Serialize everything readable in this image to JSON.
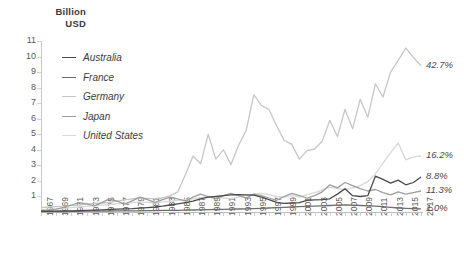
{
  "axis_title": "Billion\nUSD",
  "y_ticks": [
    0,
    1,
    2,
    3,
    4,
    5,
    6,
    7,
    8,
    9,
    10,
    11
  ],
  "y_tick_labels": [
    "",
    "1",
    "2",
    "3",
    "4",
    "5",
    "6",
    "7",
    "8",
    "9",
    "10",
    "11"
  ],
  "x_tick_labels": [
    "1967",
    "1969",
    "1971",
    "1973",
    "1975",
    "1977",
    "1979",
    "1981",
    "1983",
    "1985",
    "1987",
    "1989",
    "1991",
    "1993",
    "1995",
    "1997",
    "1999",
    "2001",
    "2003",
    "2005",
    "2007",
    "2009",
    "2011",
    "2013",
    "2015",
    "2017"
  ],
  "legend": {
    "position": "inside-top-left",
    "items": [
      {
        "label": "Australia",
        "color": "#4a4a4a"
      },
      {
        "label": "France",
        "color": "#6e6e6e"
      },
      {
        "label": "Germany",
        "color": "#c6c6c6"
      },
      {
        "label": "Japan",
        "color": "#9e9e9e"
      },
      {
        "label": "United States",
        "color": "#d8d8d8"
      }
    ]
  },
  "end_labels": [
    {
      "text": "42.7%",
      "value": 9.4,
      "series": "Germany"
    },
    {
      "text": "16.2%",
      "value": 3.6,
      "series": "United States"
    },
    {
      "text": "8.8%",
      "value": 2.25,
      "series": "Australia"
    },
    {
      "text": "11.3%",
      "value": 1.35,
      "series": "Japan"
    },
    {
      "text": "1.0%",
      "value": 0.2,
      "series": "France"
    }
  ],
  "chart_data": {
    "type": "line",
    "title": "",
    "subtitle": "",
    "xlabel": "",
    "ylabel": "Billion USD",
    "ylim": [
      0,
      11
    ],
    "xlim": [
      1967,
      2017
    ],
    "grid": false,
    "x": [
      1967,
      1968,
      1969,
      1970,
      1971,
      1972,
      1973,
      1974,
      1975,
      1976,
      1977,
      1978,
      1979,
      1980,
      1981,
      1982,
      1983,
      1984,
      1985,
      1986,
      1987,
      1988,
      1989,
      1990,
      1991,
      1992,
      1993,
      1994,
      1995,
      1996,
      1997,
      1998,
      1999,
      2000,
      2001,
      2002,
      2003,
      2004,
      2005,
      2006,
      2007,
      2008,
      2009,
      2010,
      2011,
      2012,
      2013,
      2014,
      2015,
      2016,
      2017
    ],
    "series": [
      {
        "name": "Australia",
        "color": "#4a4a4a",
        "values": [
          0.05,
          0.05,
          0.06,
          0.07,
          0.08,
          0.09,
          0.1,
          0.12,
          0.14,
          0.16,
          0.18,
          0.2,
          0.22,
          0.25,
          0.28,
          0.32,
          0.38,
          0.45,
          0.52,
          0.6,
          0.7,
          0.85,
          0.95,
          1.0,
          1.05,
          1.1,
          1.12,
          1.1,
          1.08,
          0.95,
          0.8,
          0.62,
          0.55,
          0.58,
          0.6,
          0.75,
          0.78,
          0.8,
          0.85,
          1.15,
          1.5,
          1.05,
          1.0,
          1.05,
          2.3,
          2.1,
          1.85,
          2.05,
          1.75,
          1.9,
          2.25
        ]
      },
      {
        "name": "France",
        "color": "#6e6e6e",
        "values": [
          0.02,
          0.02,
          0.03,
          0.03,
          0.04,
          0.04,
          0.05,
          0.05,
          0.06,
          0.06,
          0.07,
          0.07,
          0.08,
          0.08,
          0.09,
          0.09,
          0.1,
          0.1,
          0.11,
          0.12,
          0.13,
          0.14,
          0.15,
          0.16,
          0.17,
          0.18,
          0.19,
          0.2,
          0.22,
          0.24,
          0.26,
          0.28,
          0.3,
          0.32,
          0.34,
          0.36,
          0.38,
          0.4,
          0.42,
          0.44,
          0.46,
          0.44,
          0.42,
          0.4,
          0.38,
          0.34,
          0.3,
          0.26,
          0.23,
          0.21,
          0.2
        ]
      },
      {
        "name": "Germany",
        "color": "#c6c6c6",
        "values": [
          0.3,
          0.32,
          0.35,
          0.38,
          0.42,
          0.45,
          0.5,
          0.55,
          0.58,
          0.62,
          0.7,
          0.78,
          0.85,
          0.9,
          0.88,
          0.85,
          0.9,
          1.05,
          1.3,
          2.4,
          3.6,
          3.1,
          5.0,
          3.4,
          4.0,
          3.05,
          4.3,
          5.25,
          7.55,
          6.85,
          6.6,
          5.55,
          4.6,
          4.35,
          3.4,
          3.95,
          4.05,
          4.55,
          5.9,
          4.85,
          6.6,
          5.35,
          7.25,
          6.1,
          8.25,
          7.4,
          9.0,
          9.75,
          10.55,
          9.95,
          9.4
        ]
      },
      {
        "name": "Japan",
        "color": "#9e9e9e",
        "values": [
          0.1,
          0.12,
          0.18,
          0.3,
          0.45,
          0.6,
          0.52,
          0.4,
          0.6,
          0.85,
          0.7,
          0.5,
          0.72,
          0.95,
          0.8,
          0.62,
          0.8,
          0.95,
          0.85,
          0.7,
          0.95,
          1.15,
          1.0,
          0.85,
          1.05,
          1.2,
          1.05,
          0.9,
          1.15,
          1.05,
          0.9,
          0.75,
          1.0,
          1.2,
          1.05,
          0.9,
          1.05,
          1.3,
          1.75,
          1.55,
          1.9,
          1.7,
          1.5,
          1.35,
          1.45,
          1.25,
          1.1,
          1.3,
          1.15,
          1.25,
          1.35
        ]
      },
      {
        "name": "United States",
        "color": "#d8d8d8",
        "values": [
          0.15,
          0.18,
          0.2,
          0.24,
          0.28,
          0.32,
          0.36,
          0.4,
          0.44,
          0.48,
          0.52,
          0.56,
          0.6,
          0.65,
          0.62,
          0.58,
          0.65,
          0.7,
          0.75,
          0.8,
          0.85,
          0.9,
          1.0,
          0.95,
          0.9,
          0.85,
          0.95,
          1.05,
          1.15,
          1.2,
          1.1,
          1.0,
          0.95,
          1.05,
          0.95,
          1.1,
          1.25,
          1.4,
          1.6,
          1.5,
          1.45,
          1.55,
          1.7,
          1.95,
          2.45,
          3.15,
          3.8,
          4.45,
          3.35,
          3.55,
          3.6
        ]
      }
    ]
  }
}
